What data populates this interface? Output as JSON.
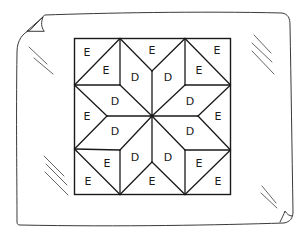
{
  "diagram": {
    "type": "quilt-block",
    "legend": {
      "D": "Diamond (parallelogram) pieces forming the star",
      "E": "Triangle pieces forming the background"
    },
    "pieces": [
      {
        "id": "e1",
        "label": "E",
        "x": 87,
        "y": 52
      },
      {
        "id": "e2",
        "label": "E",
        "x": 106,
        "y": 70
      },
      {
        "id": "d1",
        "label": "D",
        "x": 135,
        "y": 77
      },
      {
        "id": "e3",
        "label": "E",
        "x": 152,
        "y": 50
      },
      {
        "id": "d2",
        "label": "D",
        "x": 168,
        "y": 77
      },
      {
        "id": "e4",
        "label": "E",
        "x": 217,
        "y": 50
      },
      {
        "id": "e5",
        "label": "E",
        "x": 199,
        "y": 70
      },
      {
        "id": "d3",
        "label": "D",
        "x": 115,
        "y": 101
      },
      {
        "id": "d4",
        "label": "D",
        "x": 190,
        "y": 101
      },
      {
        "id": "e6",
        "label": "E",
        "x": 87,
        "y": 116
      },
      {
        "id": "e7",
        "label": "E",
        "x": 218,
        "y": 116
      },
      {
        "id": "d5",
        "label": "D",
        "x": 115,
        "y": 131
      },
      {
        "id": "d6",
        "label": "D",
        "x": 190,
        "y": 131
      },
      {
        "id": "d7",
        "label": "D",
        "x": 135,
        "y": 157
      },
      {
        "id": "d8",
        "label": "D",
        "x": 168,
        "y": 157
      },
      {
        "id": "e8",
        "label": "E",
        "x": 107,
        "y": 163
      },
      {
        "id": "e9",
        "label": "E",
        "x": 199,
        "y": 163
      },
      {
        "id": "e10",
        "label": "E",
        "x": 88,
        "y": 181
      },
      {
        "id": "e11",
        "label": "E",
        "x": 152,
        "y": 181
      },
      {
        "id": "e12",
        "label": "E",
        "x": 218,
        "y": 181
      }
    ],
    "colors": {
      "ink": "#1a1a1a",
      "paper_outline": "#3a3a3a",
      "background": "#ffffff"
    }
  }
}
